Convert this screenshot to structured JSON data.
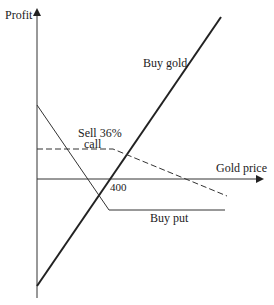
{
  "diagram": {
    "axes": {
      "y_label": "Profit",
      "x_label": "Gold price",
      "strike_label": "400"
    },
    "lines": {
      "buy_gold": {
        "label": "Buy gold",
        "style": "solid-bold"
      },
      "sell_call": {
        "label_line1": "Sell 36%",
        "label_line2": "call",
        "style": "dashed"
      },
      "buy_put": {
        "label": "Buy put",
        "style": "solid-thin"
      }
    },
    "colors": {
      "ink": "#222222",
      "background": "#ffffff"
    }
  }
}
